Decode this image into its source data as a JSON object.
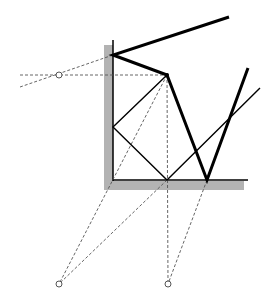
{
  "diagram": {
    "title": "",
    "colors": {
      "background": "#ffffff",
      "surface_fill": "#b3b3b3",
      "ink": "#000000",
      "construction": "#555555"
    },
    "surfaces": {
      "wall": {
        "x": 104,
        "y": 45,
        "w": 9,
        "h": 145
      },
      "floor": {
        "x": 104,
        "y": 181,
        "w": 140,
        "h": 9
      },
      "wall_edge": {
        "x1": 113,
        "y1": 40,
        "x2": 113,
        "y2": 181
      },
      "floor_edge": {
        "x1": 113,
        "y1": 180,
        "x2": 248,
        "y2": 180
      }
    },
    "thick_path": [
      [
        229,
        17
      ],
      [
        113,
        55
      ],
      [
        167,
        75
      ],
      [
        207,
        180
      ],
      [
        248,
        68
      ]
    ],
    "thin_path": [
      [
        167,
        75
      ],
      [
        113,
        127
      ],
      [
        167,
        180
      ],
      [
        260,
        88
      ]
    ],
    "dashed_lines": [
      {
        "x1": 20,
        "y1": 75,
        "x2": 167,
        "y2": 75
      },
      {
        "x1": 20,
        "y1": 87,
        "x2": 113,
        "y2": 55
      },
      {
        "x1": 167,
        "y1": 75,
        "x2": 59,
        "y2": 284
      },
      {
        "x1": 167,
        "y1": 75,
        "x2": 168,
        "y2": 284
      },
      {
        "x1": 167,
        "y1": 180,
        "x2": 59,
        "y2": 284
      },
      {
        "x1": 207,
        "y1": 180,
        "x2": 168,
        "y2": 284
      }
    ],
    "markers": [
      {
        "cx": 59,
        "cy": 75,
        "r": 3
      },
      {
        "cx": 59,
        "cy": 284,
        "r": 3
      },
      {
        "cx": 168,
        "cy": 284,
        "r": 3
      }
    ],
    "vertex_dot": {
      "cx": 167,
      "cy": 75,
      "r": 2
    }
  }
}
